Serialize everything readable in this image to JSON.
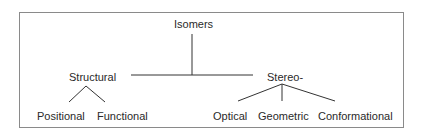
{
  "diagram": {
    "type": "tree",
    "root": {
      "label": "Isomers",
      "children": [
        {
          "label": "Structural",
          "children": [
            {
              "label": "Positional"
            },
            {
              "label": "Functional"
            }
          ]
        },
        {
          "label": "Stereo-",
          "children": [
            {
              "label": "Optical"
            },
            {
              "label": "Geometric"
            },
            {
              "label": "Conformational"
            }
          ]
        }
      ]
    }
  },
  "colors": {
    "line": "#333333",
    "border": "#8a8a8a",
    "text": "#2a2a2a"
  }
}
